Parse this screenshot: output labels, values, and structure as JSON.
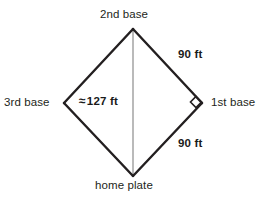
{
  "diagram": {
    "stroke_color": "#231f20",
    "diagonal_color": "#8c8c8c",
    "background": "#ffffff",
    "vertices": {
      "second_base": {
        "x": 133,
        "y": 29
      },
      "third_base": {
        "x": 64,
        "y": 103
      },
      "first_base": {
        "x": 202,
        "y": 103
      },
      "home_plate": {
        "x": 133,
        "y": 176
      }
    },
    "right_angle_marker": {
      "x": 196,
      "y": 102,
      "size": 9,
      "at": "first_base"
    }
  },
  "labels": {
    "second_base": "2nd base",
    "third_base": "3rd base",
    "first_base": "1st base",
    "home_plate": "home plate",
    "side_upper_right": "90 ft",
    "side_lower_right": "90 ft",
    "diagonal_approx_symbol": "≈",
    "diagonal_value": "127 ft"
  }
}
